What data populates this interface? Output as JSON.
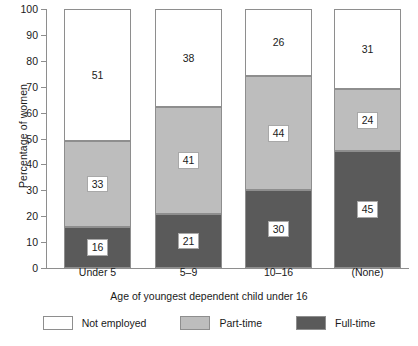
{
  "chart_data": {
    "type": "bar",
    "stacked": true,
    "title": "",
    "xlabel": "Age of youngest dependent child under 16",
    "ylabel": "Percentage of women",
    "ylim": [
      0,
      100
    ],
    "ytick_step": 10,
    "yticks": [
      0,
      10,
      20,
      30,
      40,
      50,
      60,
      70,
      80,
      90,
      100
    ],
    "ytick_labels": [
      "0",
      "10",
      "20",
      "30",
      "40",
      "50",
      "60",
      "70",
      "80",
      "90",
      "100"
    ],
    "grid": false,
    "legend_position": "bottom",
    "categories": [
      "Under 5",
      "5–9",
      "10–16",
      "(None)"
    ],
    "series": [
      {
        "name": "Full-time",
        "color": "#5a5a5a",
        "label_style": "boxed",
        "values": [
          16,
          21,
          30,
          45
        ]
      },
      {
        "name": "Part-time",
        "color": "#bdbdbd",
        "label_style": "boxed",
        "values": [
          33,
          41,
          44,
          24
        ]
      },
      {
        "name": "Not employed",
        "color": "#ffffff",
        "label_style": "plain",
        "values": [
          51,
          38,
          26,
          31
        ]
      }
    ],
    "legend_order": [
      "Not employed",
      "Part-time",
      "Full-time"
    ]
  },
  "axes": {
    "y_title": "Percentage of women",
    "x_title": "Age of youngest dependent child under 16"
  },
  "legend": {
    "items": [
      {
        "label": "Not employed",
        "color": "#ffffff"
      },
      {
        "label": "Part-time",
        "color": "#bdbdbd"
      },
      {
        "label": "Full-time",
        "color": "#5a5a5a"
      }
    ]
  }
}
